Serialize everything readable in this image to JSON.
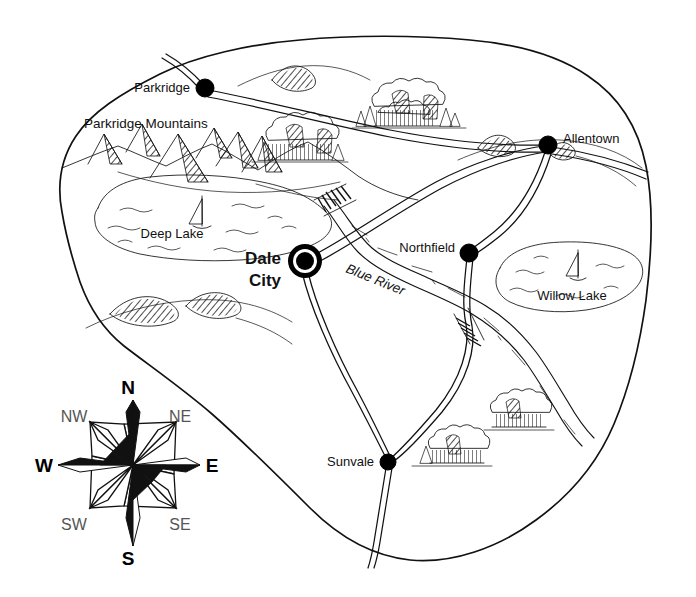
{
  "map": {
    "title": "Island map with towns, roads, lakes and river",
    "background_color": "#ffffff",
    "ink_color": "#111111"
  },
  "towns": [
    {
      "name": "Parkridge",
      "label": "Parkridge",
      "type": "town",
      "marker": "filled-circle",
      "x": 205,
      "y": 88,
      "label_x": 196,
      "label_y": 92,
      "label_anchor": "end"
    },
    {
      "name": "Allentown",
      "label": "Allentown",
      "type": "town",
      "marker": "filled-circle",
      "x": 548,
      "y": 145,
      "label_x": 562,
      "label_y": 143,
      "label_anchor": "start"
    },
    {
      "name": "Northfield",
      "label": "Northfield",
      "type": "town",
      "marker": "filled-circle",
      "x": 469,
      "y": 253,
      "label_x": 456,
      "label_y": 252,
      "label_anchor": "end"
    },
    {
      "name": "Sunvale",
      "label": "Sunvale",
      "type": "town",
      "marker": "filled-circle",
      "x": 388,
      "y": 462,
      "label_x": 375,
      "label_y": 466,
      "label_anchor": "end"
    },
    {
      "name": "Dale City",
      "label": "Dale City",
      "type": "capital",
      "marker": "double-ring-circle",
      "x": 305,
      "y": 261,
      "label_x": 283,
      "label_y": 258,
      "label_anchor": "end",
      "label_lines": [
        "Dale",
        "City"
      ]
    }
  ],
  "water": [
    {
      "name": "Deep Lake",
      "label": "Deep Lake",
      "label_x": 172,
      "label_y": 238,
      "has_sailboat": true
    },
    {
      "name": "Willow Lake",
      "label": "Willow Lake",
      "label_x": 572,
      "label_y": 298,
      "has_sailboat": true
    }
  ],
  "rivers": [
    {
      "name": "Blue River",
      "label": "Blue River",
      "label_x": 345,
      "label_y": 272,
      "rotation": 22,
      "style": "italic"
    }
  ],
  "regions": [
    {
      "name": "Parkridge Mountains",
      "label": "Parkridge Mountains",
      "label_x": 84,
      "label_y": 128,
      "label_anchor": "start"
    }
  ],
  "compass": {
    "name": "compass-rose",
    "center_x": 133,
    "center_y": 465,
    "cardinals": [
      {
        "label": "N",
        "x": 128,
        "y": 394
      },
      {
        "label": "E",
        "x": 210,
        "y": 472
      },
      {
        "label": "S",
        "x": 128,
        "y": 562
      },
      {
        "label": "W",
        "x": 44,
        "y": 472
      }
    ],
    "ordinals": [
      {
        "label": "NE",
        "x": 178,
        "y": 421
      },
      {
        "label": "SE",
        "x": 178,
        "y": 527
      },
      {
        "label": "SW",
        "x": 74,
        "y": 527
      },
      {
        "label": "NW",
        "x": 74,
        "y": 421
      }
    ]
  },
  "legend_symbols": {
    "town_marker": "filled-circle",
    "capital_marker": "double-ring-circle",
    "mountain": "hatched-peak",
    "hill": "hatched-mound",
    "forest": "tree-cluster",
    "bridge": "hatched-crossing",
    "sailboat": "triangular-sail"
  }
}
